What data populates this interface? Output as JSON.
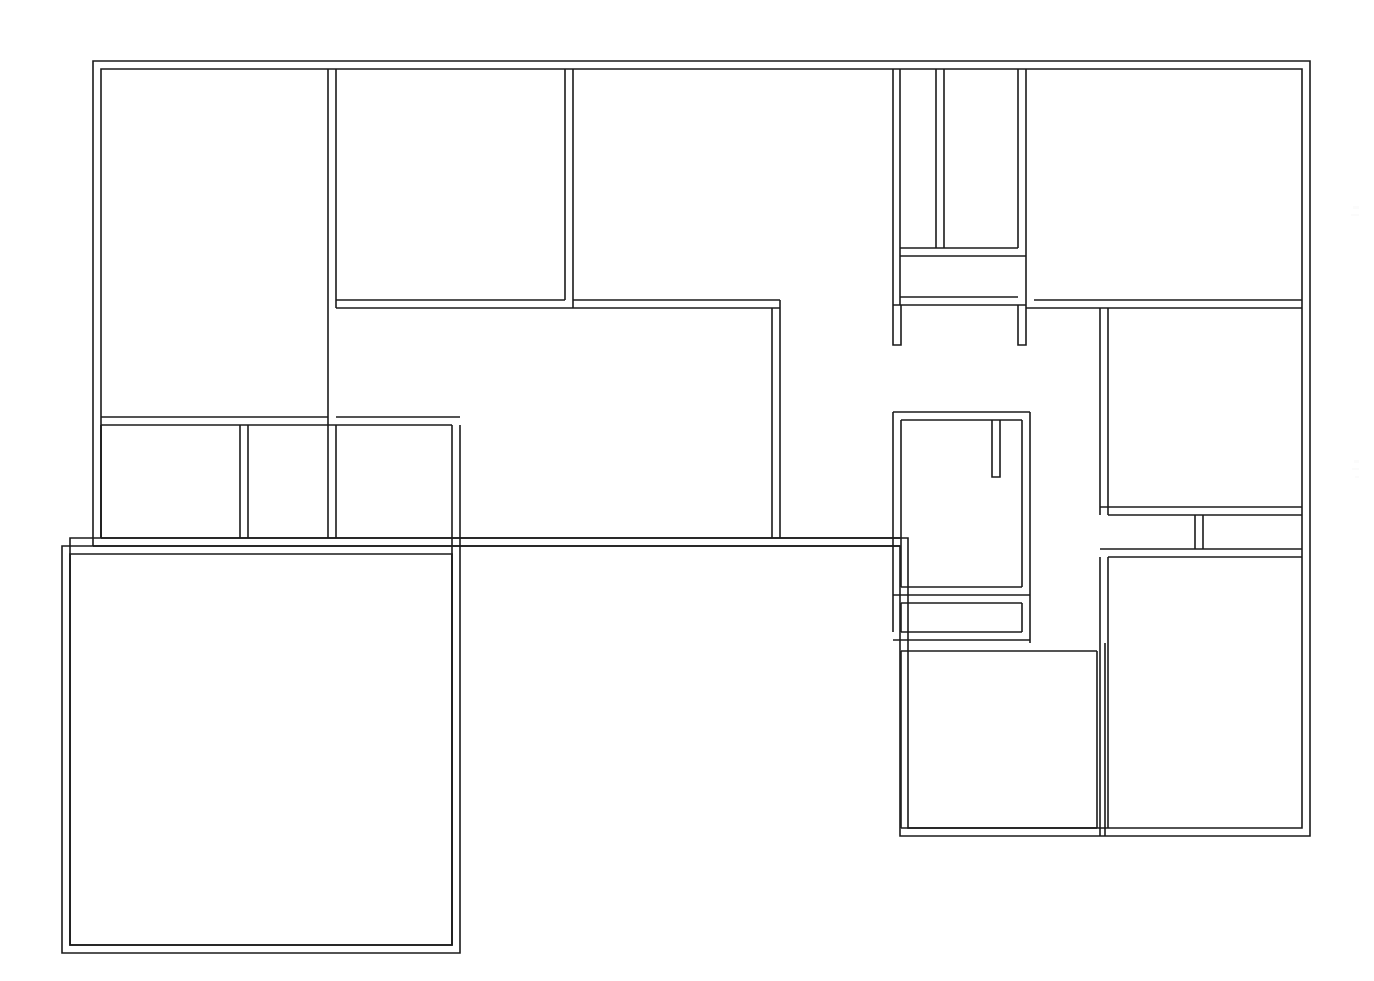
{
  "document": {
    "kind": "architectural-floor-plan",
    "title": "",
    "style": "double-line wall outline, no annotations",
    "background_color": "#ffffff",
    "line_color": "#1b1b1b",
    "wall_thickness_px": 8,
    "canvas": {
      "width": 1374,
      "height": 981
    }
  },
  "plan": {
    "outline_description": "L-shaped building footprint with an upper block spanning the full width and a lower-left wing plus a lower-right wing",
    "wall_thickness": 8,
    "outer_boundary_points": "93,61 1310,61 1310,836 1100,836 1100,836 900,836 900,546 62,546 62,953 460,953 460,546",
    "rooms": [
      {
        "id": "room-top-left",
        "name": "upper-left-room",
        "x": 93,
        "y": 61,
        "w": 243,
        "h": 364
      },
      {
        "id": "room-top-mid",
        "name": "upper-middle-room",
        "x": 336,
        "y": 61,
        "w": 237,
        "h": 247
      },
      {
        "id": "room-top-wide",
        "name": "upper-wide-room",
        "x": 573,
        "y": 61,
        "w": 328,
        "h": 247
      },
      {
        "id": "room-narrow-a",
        "name": "narrow-closet-left",
        "x": 900,
        "y": 61,
        "w": 44,
        "h": 195
      },
      {
        "id": "room-narrow-b",
        "name": "narrow-closet-right",
        "x": 944,
        "y": 61,
        "w": 82,
        "h": 195
      },
      {
        "id": "room-top-right",
        "name": "upper-right-room",
        "x": 1026,
        "y": 61,
        "w": 284,
        "h": 247
      },
      {
        "id": "room-strip-upper",
        "name": "upper-hall-strip",
        "x": 900,
        "y": 256,
        "w": 126,
        "h": 49
      },
      {
        "id": "room-center",
        "name": "central-living-room",
        "x": 336,
        "y": 308,
        "w": 444,
        "h": 238
      },
      {
        "id": "room-small-a",
        "name": "small-room-left",
        "x": 93,
        "y": 425,
        "w": 155,
        "h": 121
      },
      {
        "id": "room-small-b",
        "name": "small-room-middle",
        "x": 248,
        "y": 425,
        "w": 88,
        "h": 121
      },
      {
        "id": "room-small-c",
        "name": "small-room-right",
        "x": 336,
        "y": 425,
        "w": 124,
        "h": 121
      },
      {
        "id": "room-right-mid",
        "name": "right-middle-room",
        "x": 1108,
        "y": 308,
        "w": 202,
        "h": 207
      },
      {
        "id": "room-tiny-left",
        "name": "tiny-room-left",
        "x": 1108,
        "y": 515,
        "w": 95,
        "h": 42
      },
      {
        "id": "room-tiny-right",
        "name": "tiny-room-right",
        "x": 1203,
        "y": 515,
        "w": 107,
        "h": 42
      },
      {
        "id": "room-mid-right-bath",
        "name": "bathroom-with-partition",
        "x": 900,
        "y": 420,
        "w": 130,
        "h": 175
      },
      {
        "id": "room-strip-lower",
        "name": "lower-hall-strip",
        "x": 900,
        "y": 595,
        "w": 130,
        "h": 37
      },
      {
        "id": "room-bottom-left-big",
        "name": "bottom-left-large-room",
        "x": 62,
        "y": 546,
        "w": 398,
        "h": 407
      },
      {
        "id": "room-bottom-mid",
        "name": "bottom-middle-room",
        "x": 900,
        "y": 643,
        "w": 205,
        "h": 193
      },
      {
        "id": "room-bottom-right",
        "name": "bottom-right-room",
        "x": 1105,
        "y": 557,
        "w": 205,
        "h": 279
      }
    ],
    "wall_stubs": [
      {
        "id": "stub-a",
        "name": "door-jamb-stub-left",
        "x": 900,
        "y": 305,
        "w": 8,
        "h": 40
      },
      {
        "id": "stub-b",
        "name": "door-jamb-stub-right",
        "x": 1018,
        "y": 305,
        "w": 8,
        "h": 40
      },
      {
        "id": "stub-c",
        "name": "partition-stub-interior",
        "x": 992,
        "y": 420,
        "w": 8,
        "h": 57
      }
    ],
    "openings_note": "Gaps between wall runs represent doorways; no door swings are drawn."
  },
  "legend": {
    "has_legend": false,
    "has_dimensions": false,
    "has_room_labels": false,
    "has_north_arrow": false,
    "has_scale_bar": false
  }
}
